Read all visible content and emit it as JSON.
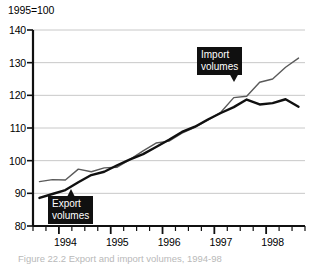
{
  "figure": {
    "index_note": "1995=100",
    "caption": "Figure 22.2  Export and import volumes, 1994-98"
  },
  "chart_data": {
    "type": "line",
    "title": "1995=100",
    "xlabel": "",
    "ylabel": "",
    "ylim": [
      80,
      140
    ],
    "xlim": [
      1993.5,
      1998.75
    ],
    "ytick_labels": [
      "140",
      "130",
      "120",
      "110",
      "100",
      "90",
      "80"
    ],
    "yticks": [
      140,
      130,
      120,
      110,
      100,
      90,
      80
    ],
    "xtick_labels": [
      "1994",
      "1995",
      "1996",
      "1997",
      "1998"
    ],
    "xticks": [
      1994,
      1995,
      1996,
      1997,
      1998
    ],
    "grid": "horizontal",
    "legend": "annotated-callouts",
    "minor_ticks": "quarterly",
    "annotations": [
      {
        "label_line1": "Import",
        "label_line2": "volumes",
        "points_to": "import-series"
      },
      {
        "label_line1": "Export",
        "label_line2": "volumes",
        "points_to": "export-series"
      }
    ],
    "x": [
      1993.625,
      1993.875,
      1994.125,
      1994.375,
      1994.625,
      1994.875,
      1995.125,
      1995.375,
      1995.625,
      1995.875,
      1996.125,
      1996.375,
      1996.625,
      1996.875,
      1997.125,
      1997.375,
      1997.625,
      1997.875,
      1998.125,
      1998.375,
      1998.625
    ],
    "series": [
      {
        "name": "Import volumes",
        "color": "#5a5a5a",
        "linewidth": 1.4,
        "values": [
          93.6,
          94.2,
          94.1,
          97.4,
          96.6,
          97.8,
          98.0,
          100.4,
          103.0,
          105.4,
          106.0,
          108.4,
          110.2,
          112.4,
          114.8,
          119.3,
          119.7,
          124.0,
          125.0,
          128.6,
          131.4
        ]
      },
      {
        "name": "Export volumes",
        "color": "#101010",
        "linewidth": 2.4,
        "values": [
          88.6,
          89.8,
          91.0,
          93.4,
          95.6,
          96.6,
          98.6,
          100.4,
          102.0,
          104.2,
          106.4,
          108.8,
          110.4,
          112.6,
          114.6,
          116.4,
          118.7,
          117.2,
          117.6,
          118.8,
          116.5
        ]
      }
    ]
  }
}
